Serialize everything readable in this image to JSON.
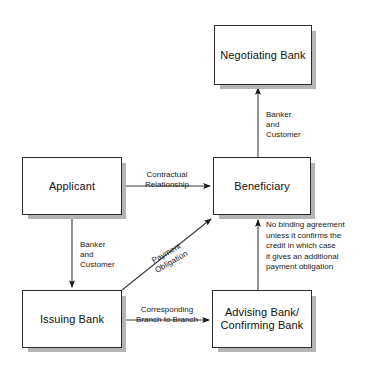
{
  "diagram": {
    "background_color": "#ffffff",
    "box_fill": "#ffffff",
    "box_border_color": "#2b2b2b",
    "box_shadow_color": "#b4b4b4",
    "line_color": "#3a3a3a",
    "nodes": [
      {
        "id": "negotiating_bank",
        "label": "Negotiating Bank"
      },
      {
        "id": "applicant",
        "label": "Applicant"
      },
      {
        "id": "beneficiary",
        "label": "Beneficiary"
      },
      {
        "id": "issuing_bank",
        "label": "Issuing Bank"
      },
      {
        "id": "advising_bank",
        "label": "Advising Bank/\nConfirming Bank"
      }
    ],
    "edges": [
      {
        "id": "applicant_to_beneficiary",
        "from": "applicant",
        "to": "beneficiary",
        "label": "Contractual\nRelationship"
      },
      {
        "id": "applicant_to_issuing_bank",
        "from": "applicant",
        "to": "issuing_bank",
        "label": "Banker\nand\nCustomer"
      },
      {
        "id": "beneficiary_to_negotiating_bank",
        "from": "beneficiary",
        "to": "negotiating_bank",
        "label": "Banker\nand\nCustomer"
      },
      {
        "id": "issuing_bank_to_beneficiary",
        "from": "issuing_bank",
        "to": "beneficiary",
        "label": "Payment\nObligation"
      },
      {
        "id": "issuing_bank_to_advising_bank",
        "from": "issuing_bank",
        "to": "advising_bank",
        "label": "Corresponding\nBranch to Branch"
      },
      {
        "id": "advising_bank_to_beneficiary",
        "from": "advising_bank",
        "to": "beneficiary",
        "label": "No binding agreement\nunless it confirms the\ncredit in which case\nit gives an additional\npayment obligation"
      }
    ]
  }
}
